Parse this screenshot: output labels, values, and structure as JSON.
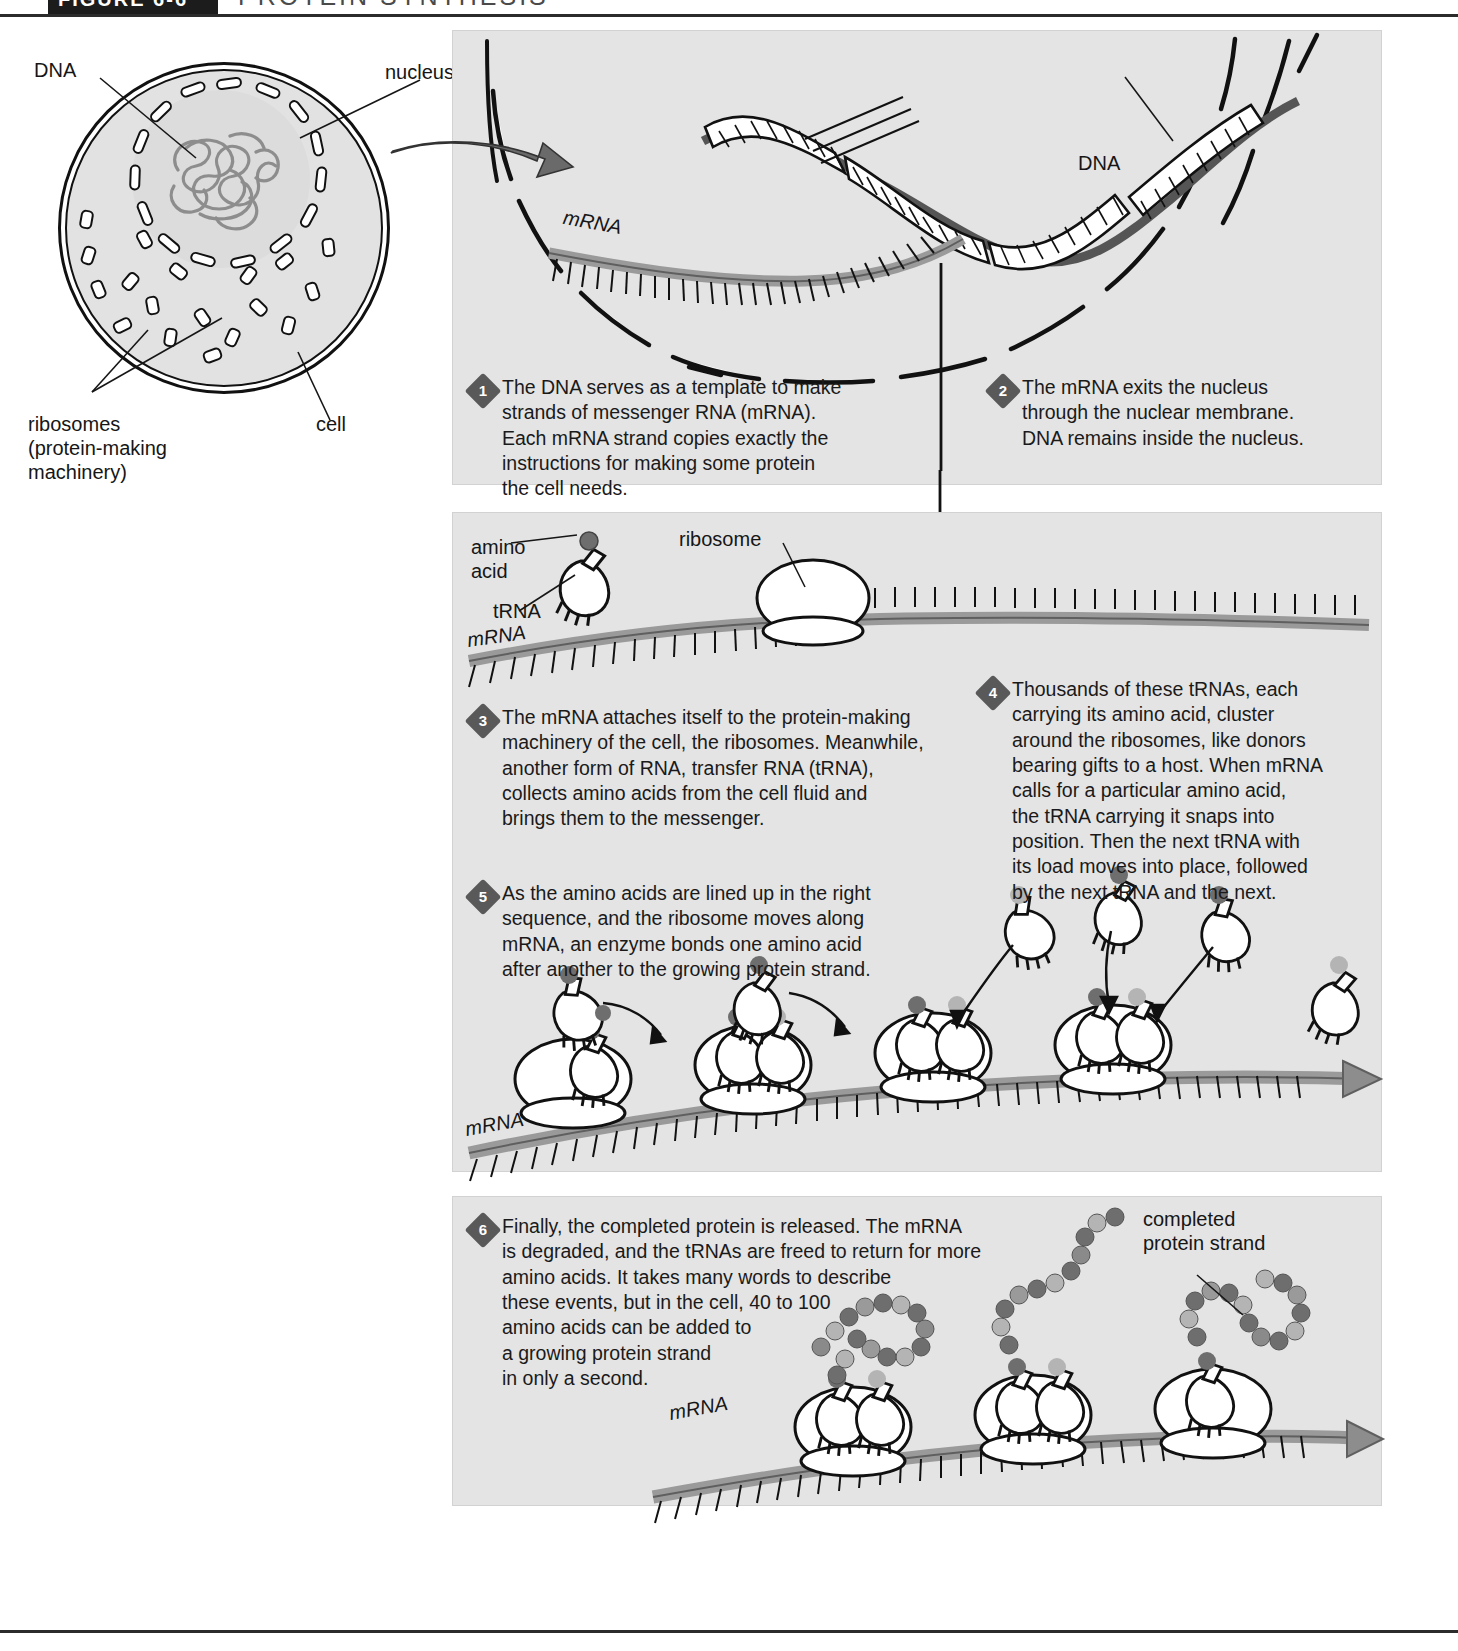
{
  "figure": {
    "tag": "FIGURE 6-6",
    "title": "PROTEIN SYNTHESIS"
  },
  "cell_diagram": {
    "labels": {
      "dna": "DNA",
      "nucleus": "nucleus",
      "ribosomes": "ribosomes\n(protein-making\nmachinery)",
      "cell": "cell"
    }
  },
  "panel1": {
    "labels": {
      "mrna": "mRNA",
      "dna": "DNA"
    }
  },
  "panel2": {
    "labels": {
      "amino_acid": "amino\nacid",
      "trna": "tRNA",
      "ribosome": "ribosome",
      "mrna_top": "mRNA",
      "mrna_bottom": "mRNA"
    }
  },
  "panel3": {
    "labels": {
      "completed_protein": "completed\nprotein strand",
      "mrna": "mRNA"
    }
  },
  "steps": [
    {
      "number": "1",
      "text": "The DNA serves as a template to make\nstrands of messenger RNA (mRNA).\nEach mRNA strand copies exactly the\ninstructions for making some protein\nthe cell needs."
    },
    {
      "number": "2",
      "text": "The mRNA exits the nucleus\nthrough the nuclear membrane.\nDNA remains inside the nucleus."
    },
    {
      "number": "3",
      "text": "The mRNA attaches itself to the protein-making\nmachinery of the cell, the ribosomes. Meanwhile,\nanother form of RNA, transfer RNA (tRNA),\ncollects amino acids from the cell fluid and\nbrings them to the messenger."
    },
    {
      "number": "4",
      "text": "Thousands of these tRNAs, each\ncarrying its amino acid, cluster\naround the ribosomes, like donors\nbearing gifts to a host. When mRNA\ncalls for a particular amino acid,\nthe tRNA carrying it snaps into\nposition. Then the next tRNA with\nits load moves into place, followed\nby the next tRNA and the next."
    },
    {
      "number": "5",
      "text": "As the amino acids are lined up in the right\nsequence, and the ribosome moves along\nmRNA, an enzyme bonds one amino acid\nafter another to the growing protein strand."
    },
    {
      "number": "6",
      "text": "Finally, the completed protein is released. The mRNA\nis degraded, and the tRNAs are freed to return for more\namino acids. It takes many words to describe\nthese events, but in the cell, 40 to 100\namino acids can be added to\na growing protein strand\nin only a second."
    }
  ],
  "colors": {
    "panel_bg": "#e4e4e4",
    "ink": "#161616",
    "strand_gray": "#8a8a8a",
    "strand_dark": "#6e6e6e",
    "amino_dark": "#595959",
    "amino_light": "#b4b4b4",
    "tag_bg": "#1c1c1c"
  }
}
